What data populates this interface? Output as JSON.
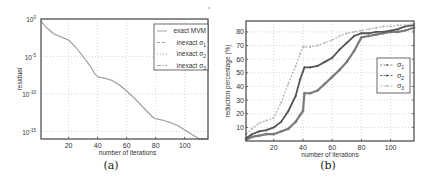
{
  "chart_data": [
    {
      "panel": "(a)",
      "type": "line",
      "title": "",
      "xlabel": "number of iterations",
      "ylabel": "residual",
      "yscale": "log",
      "xlim": [
        1,
        116
      ],
      "ylim_exp": [
        -16,
        0
      ],
      "xticks": [
        20,
        40,
        60,
        80,
        100
      ],
      "yticks": [
        "10^0",
        "10^-5",
        "10^-10",
        "10^-15"
      ],
      "ytick_exps": [
        0,
        -5,
        -10,
        -15
      ],
      "grid": true,
      "legend_position": "upper right",
      "legend": [
        "exact MVM",
        "inexact σ1",
        "inexact σ2",
        "inexact σ3"
      ],
      "series": [
        {
          "name": "exact MVM",
          "style": "solid",
          "x": [
            1,
            5,
            10,
            15,
            20,
            25,
            30,
            35,
            38,
            40,
            45,
            50,
            55,
            60,
            65,
            70,
            75,
            78,
            80,
            85,
            90,
            95,
            100,
            105,
            110,
            116
          ],
          "log10_y": [
            -0.3,
            -1.2,
            -2.0,
            -2.4,
            -2.8,
            -3.8,
            -5.0,
            -6.3,
            -7.3,
            -7.7,
            -7.9,
            -8.2,
            -8.8,
            -9.6,
            -10.5,
            -11.5,
            -12.5,
            -13.1,
            -13.3,
            -13.5,
            -13.8,
            -14.2,
            -14.8,
            -15.4,
            -16.0,
            -16.8
          ]
        },
        {
          "name": "inexact σ1",
          "style": "dashed",
          "note": "overlaps exact MVM"
        },
        {
          "name": "inexact σ2",
          "style": "dotted",
          "note": "overlaps exact MVM"
        },
        {
          "name": "inexact σ3",
          "style": "dashdot",
          "note": "overlaps exact MVM"
        }
      ]
    },
    {
      "panel": "(b)",
      "type": "line",
      "title": "",
      "xlabel": "number of iterations",
      "ylabel": "reduction percentage (%)",
      "xlim": [
        1,
        116
      ],
      "ylim": [
        0,
        88
      ],
      "xticks": [
        20,
        40,
        60,
        80,
        100
      ],
      "yticks": [
        10,
        20,
        30,
        40,
        50,
        60,
        70,
        80
      ],
      "grid": true,
      "legend_position": "center right",
      "legend": [
        "σ1",
        "σ2",
        "σ3"
      ],
      "x": [
        1,
        5,
        10,
        15,
        20,
        25,
        30,
        35,
        38,
        40,
        41,
        45,
        50,
        55,
        60,
        65,
        70,
        75,
        80,
        85,
        90,
        95,
        100,
        105,
        110,
        116
      ],
      "series": [
        {
          "name": "σ1",
          "marker": "circle",
          "values": [
            1,
            3,
            4,
            5,
            5,
            7,
            9,
            14,
            19,
            22,
            35,
            35,
            37,
            42,
            47,
            52,
            58,
            66,
            76,
            77,
            78,
            79,
            80,
            80,
            81,
            83
          ]
        },
        {
          "name": "σ2",
          "marker": "dot",
          "values": [
            2,
            5,
            7,
            8,
            10,
            14,
            22,
            33,
            45,
            51,
            54,
            54,
            55,
            58,
            61,
            67,
            72,
            77,
            79,
            79,
            80,
            80,
            81,
            82,
            84,
            85
          ]
        },
        {
          "name": "σ3",
          "marker": "x",
          "values": [
            5,
            9,
            13,
            15,
            17,
            28,
            42,
            55,
            64,
            69,
            69,
            69,
            70,
            72,
            74,
            77,
            79,
            80,
            81,
            82,
            83,
            84,
            84,
            85,
            85,
            86
          ]
        }
      ]
    }
  ],
  "captions": {
    "a": "(a)",
    "b": "(b)"
  }
}
